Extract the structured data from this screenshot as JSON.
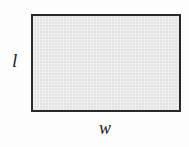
{
  "diagram": {
    "type": "rectangle",
    "shape_name": "rectangle",
    "fill_color": "#e9e9e9",
    "stroke_color": "#2a2a2a",
    "background_color": "#fdfdfd",
    "labels": {
      "length": "l",
      "width": "w"
    }
  },
  "chart_data": {
    "type": "diagram",
    "title": "",
    "shape": "rectangle",
    "annotations": [
      {
        "text": "l",
        "meaning": "length",
        "position": "left-side-vertical-edge"
      },
      {
        "text": "w",
        "meaning": "width",
        "position": "below-bottom-horizontal-edge"
      }
    ]
  }
}
